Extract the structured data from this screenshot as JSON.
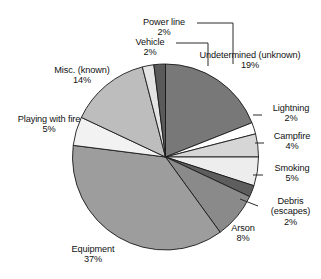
{
  "chart_data": {
    "type": "pie",
    "title": "",
    "subtitle": "",
    "xlabel": "",
    "ylabel": "",
    "legend_position": "none",
    "grid": false,
    "units": "percent",
    "start_angle_deg": -90,
    "direction": "clockwise",
    "categories": [
      "Undetermined (unknown)",
      "Lightning",
      "Campfire",
      "Smoking",
      "Debris (escapes)",
      "Arson",
      "Equipment",
      "Playing with fire",
      "Misc. (known)",
      "Vehicle",
      "Power line"
    ],
    "values": [
      19,
      2,
      4,
      5,
      2,
      8,
      37,
      5,
      14,
      2,
      2
    ],
    "slices": [
      {
        "label": "Undetermined (unknown)",
        "value": 19,
        "value_text": "19%",
        "color": "#787878"
      },
      {
        "label": "Lightning",
        "value": 2,
        "value_text": "2%",
        "color": "#ffffff"
      },
      {
        "label": "Campfire",
        "value": 4,
        "value_text": "4%",
        "color": "#d6d6d6"
      },
      {
        "label": "Smoking",
        "value": 5,
        "value_text": "5%",
        "color": "#ededed"
      },
      {
        "label": "Debris (escapes)",
        "value": 2,
        "value_text": "2%",
        "color": "#5e5e5e"
      },
      {
        "label": "Arson",
        "value": 8,
        "value_text": "8%",
        "color": "#8a8a8a"
      },
      {
        "label": "Equipment",
        "value": 37,
        "value_text": "37%",
        "color": "#9d9d9d"
      },
      {
        "label": "Playing with fire",
        "value": 5,
        "value_text": "5%",
        "color": "#f2f2f2"
      },
      {
        "label": "Misc. (known)",
        "value": 14,
        "value_text": "14%",
        "color": "#bdbdbd"
      },
      {
        "label": "Vehicle",
        "value": 2,
        "value_text": "2%",
        "color": "#e4e4e4"
      },
      {
        "label": "Power line",
        "value": 2,
        "value_text": "2%",
        "color": "#5a5a5a"
      }
    ]
  },
  "labels": {
    "undetermined": {
      "name": "Undetermined (unknown)",
      "pct": "19%"
    },
    "lightning": {
      "name": "Lightning",
      "pct": "2%"
    },
    "campfire": {
      "name": "Campfire",
      "pct": "4%"
    },
    "smoking": {
      "name": "Smoking",
      "pct": "5%"
    },
    "debris": {
      "name": "Debris",
      "name2": "(escapes)",
      "pct": "2%"
    },
    "arson": {
      "name": "Arson",
      "pct": "8%"
    },
    "equipment": {
      "name": "Equipment",
      "pct": "37%"
    },
    "playing_with_fire": {
      "name": "Playing with fire",
      "pct": "5%"
    },
    "misc": {
      "name": "Misc. (known)",
      "pct": "14%"
    },
    "vehicle": {
      "name": "Vehicle",
      "pct": "2%"
    },
    "power_line": {
      "name": "Power line",
      "pct": "2%"
    }
  },
  "style": {
    "slice_outline": "#1a1a1a",
    "leader_line": "#2a2a2a",
    "background": "#ffffff"
  }
}
